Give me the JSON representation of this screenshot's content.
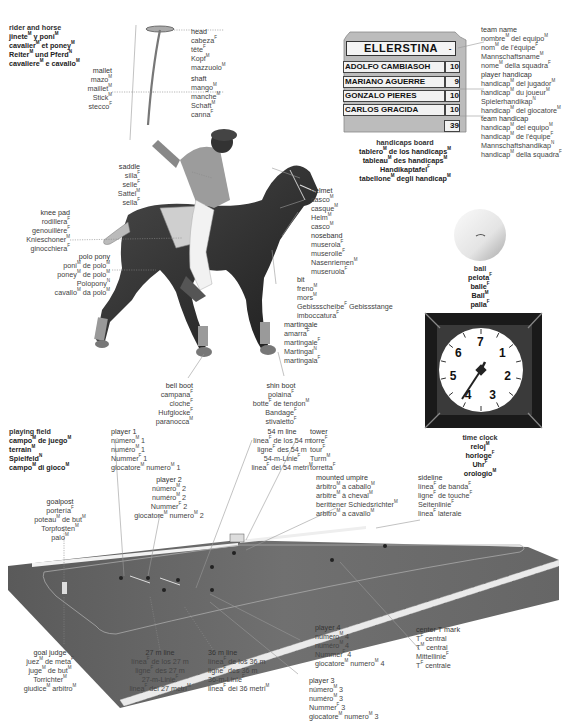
{
  "title_block": {
    "lines": [
      "rider and horse",
      "jinete|M| y poni|M|",
      "cavalier|M| et poney|M|",
      "Reiter|M| und Pferd|N|",
      "cavaliere|M| e cavallo|M|"
    ]
  },
  "labels": {
    "mallet": [
      "mallet",
      "mazo|M|",
      "maillet|M|",
      "Stick|M|",
      "stecco|F|"
    ],
    "head": [
      "head",
      "cabeza|F|",
      "tête|F|",
      "Kopf|M|",
      "mazzuolo|M|"
    ],
    "shaft": [
      "shaft",
      "mango|M|",
      "manche|M|",
      "Schaft|M|",
      "canna|F|"
    ],
    "saddle": [
      "saddle",
      "silla|F|",
      "selle|F|",
      "Sattel|M|",
      "sella|F|"
    ],
    "knee_pad": [
      "knee pad",
      "rodillera|F|",
      "genouillère|F|",
      "Knieschoner|M|",
      "ginocchiera|F|"
    ],
    "polo_pony": [
      "polo pony",
      "poni|M| de polo|M|",
      "poney|M| de polo|M|",
      "Polopony|N|",
      "cavallo|M| da polo|M|"
    ],
    "helmet": [
      "helmet",
      "casco|M|",
      "casque|M|",
      "Helm|M|",
      "casco|M|"
    ],
    "noseband": [
      "noseband",
      "muserola|F|",
      "muserolle|F|",
      "Nasenriemen|M|",
      "museruola|F|"
    ],
    "bit": [
      "bit",
      "freno|M|",
      "mors|M|",
      "Gebissscheibe|F| Gebissstange",
      "imboccatura|F|"
    ],
    "martingale": [
      "martingale",
      "amarra|F|",
      "martingale|F|",
      "Martingal|N|",
      "martingala|F|"
    ],
    "bell_boot": [
      "bell boot",
      "campana|F|",
      "cloche|F|",
      "Hufglocke|F|",
      "paranocca|M|"
    ],
    "shin_boot": [
      "shin boot",
      "polaina|F|",
      "botte|F| de tendon|M|",
      "Bandage|F|",
      "stivaletto|F|"
    ],
    "team_name": [
      "team name",
      "nombre|M| del equipo|M|",
      "nom|M| de l'équipe|F|",
      "Mannschaftsname|M|",
      "nome|M| della squadra|F|"
    ],
    "player_handicap": [
      "player handicap",
      "handicap|M| del jugador|M|",
      "handicap|M| du joueur|M|",
      "Spielerhandikap|N|",
      "handicap|M| del giocatore|M|"
    ],
    "team_handicap": [
      "team handicap",
      "handicap|M| del equipo|M|",
      "handicap|M| de l'équipe|F|",
      "Mannschaftshandikap|N|",
      "handicap|M| della squadra|F|"
    ],
    "handicaps_board": [
      "handicaps board",
      "tablero|M| de los handicaps|M|",
      "tableau|M| des handicaps|M|",
      "Handikaptafel|F|",
      "tabellone|M| degli handicap|M|"
    ],
    "ball": [
      "ball",
      "pelota|F|",
      "balle|F|",
      "Ball|M|",
      "palla|F|"
    ],
    "time_clock": [
      "time clock",
      "reloj|M|",
      "horloge|F|",
      "Uhr|F|",
      "orologio|M|"
    ],
    "playing_field": [
      "playing field",
      "campo|M| de juego|M|",
      "terrain|M|",
      "Spielfeld|N|",
      "campo|M| di gioco|M|"
    ],
    "player_1": [
      "player 1",
      "número|M| 1",
      "numéro|M| 1",
      "Nummer|F| 1",
      "giocatore|M| numero|M| 1"
    ],
    "player_2": [
      "player 2",
      "número|M| 2",
      "numéro|M| 2",
      "Nummer|F| 2",
      "giocatore|M| numero|M| 2"
    ],
    "player_3": [
      "player 3",
      "número|M| 3",
      "numéro|M| 3",
      "Nummer|F| 3",
      "giocatore|M| numero|M| 3"
    ],
    "player_4": [
      "player 4",
      "número|M| 4",
      "numéro|M| 4",
      "Nummer|F| 4",
      "giocatore|M| numero|M| 4"
    ],
    "line_54": [
      "54 m line",
      "línea|F| de los 54 m",
      "ligne|F| des 54 m",
      "54-m-Linie|F|",
      "linea|F| dei 54 metri|M|"
    ],
    "tower": [
      "tower",
      "torre|F|",
      "tour|F|",
      "Turm|M|",
      "torretta|F|"
    ],
    "mounted_umpire": [
      "mounted umpire",
      "árbitro|M| a caballo|M|",
      "arbitre|M| à cheval|M|",
      "berittener Schiedsrichter|M|",
      "arbitro|M| a cavallo|M|"
    ],
    "sideline": [
      "sideline",
      "línea|F| de banda|F|",
      "ligne|F| de touche|F|",
      "Seitenlinie|F|",
      "linea|F| laterale"
    ],
    "goalpost": [
      "goalpost",
      "portería|F|",
      "poteau|M| de but|M|",
      "Torpfosten|M|",
      "palo|M|"
    ],
    "goal_judge": [
      "goal judge",
      "juez|M| de meta|F|",
      "juge|M| de but|M|",
      "Torrichter|M|",
      "giudice|M| arbitro|M|"
    ],
    "line_27": [
      "27 m line",
      "línea|F| de los 27 m",
      "ligne|F| des 27 m",
      "27-m-Linie|F|",
      "linea|F| dei 27 metri|M|"
    ],
    "line_36": [
      "36 m line",
      "línea|F| de los 36 m",
      "ligne|F| des 36 m",
      "36-m-Linie|F|",
      "linea|F| dei 36 metri|M|"
    ],
    "center_t": [
      "center T mark",
      "T|F| central",
      "T|M| central",
      "Mittellinie|F|",
      "T|F| centrale"
    ]
  },
  "board": {
    "team_name": "ELLERSTINA",
    "team_name_suffix": "-",
    "players": [
      {
        "name": "ADOLFO CAMBIASOH",
        "handicap": "10"
      },
      {
        "name": "MARIANO AGUERRE",
        "handicap": "9"
      },
      {
        "name": "GONZALO PIERES",
        "handicap": "10"
      },
      {
        "name": "CARLOS GRACIDA",
        "handicap": "10"
      }
    ],
    "total": "39"
  },
  "clock": {
    "numbers": [
      "7",
      "1",
      "2",
      "3",
      "4",
      "5",
      "6"
    ]
  },
  "colors": {
    "field": "#6e6e6e",
    "board": "#bdbdbd",
    "clock_frame": "#1a1a1a"
  }
}
